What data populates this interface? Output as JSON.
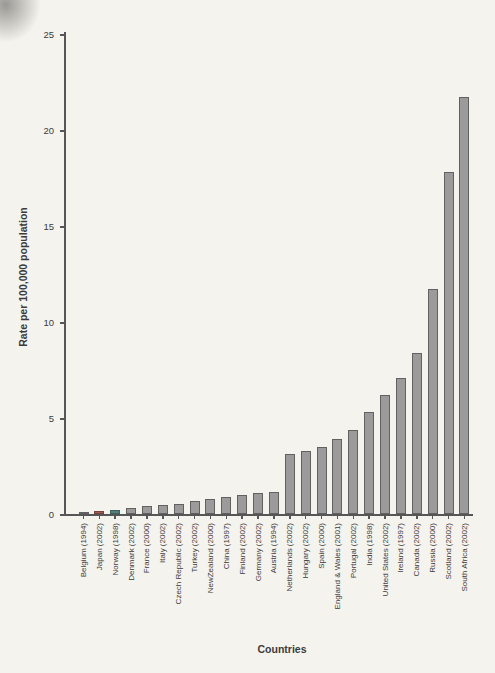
{
  "figure": {
    "background": "#f5f3ee",
    "text_color": "#3b3b3b",
    "axis_color": "#565656",
    "bar_fill": "#9b9b9b",
    "bar_stroke": "#616161"
  },
  "chart_data": {
    "type": "bar",
    "title": "",
    "xlabel": "Countries",
    "ylabel": "Rate per 100,000 population",
    "ylim": [
      0,
      25
    ],
    "yticks": [
      0,
      5,
      10,
      15,
      20,
      25
    ],
    "grid": "off",
    "legend": "none",
    "categories": [
      "Belgium (1994)",
      "Japan (2002)",
      "Norway (1998)",
      "Denmark (2002)",
      "France (2000)",
      "Italy (2002)",
      "Czech Republic (2002)",
      "Turkey (2002)",
      "NewZealand (2000)",
      "China (1997)",
      "Finland (2002)",
      "Germany (2002)",
      "Austria (1994)",
      "Netherlands (2002)",
      "Hungary (2002)",
      "Spain (2000)",
      "England & Wales (2001)",
      "Portugal (2002)",
      "India (1998)",
      "United States (2002)",
      "Ireland (1997)",
      "Canada (2002)",
      "Russia (2000)",
      "Scotland (2002)",
      "South Africa (2002)"
    ],
    "values": [
      0.1,
      0.15,
      0.2,
      0.3,
      0.4,
      0.45,
      0.5,
      0.7,
      0.8,
      0.9,
      1.0,
      1.1,
      1.15,
      3.1,
      3.3,
      3.5,
      3.9,
      4.4,
      5.3,
      6.2,
      7.1,
      8.4,
      11.7,
      17.8,
      21.7
    ],
    "point_colors": {
      "Japan (2002)": {
        "fill": "#9a6058",
        "stroke": "#7c4038"
      },
      "Norway (1998)": {
        "fill": "#567f7c",
        "stroke": "#3a625f"
      }
    }
  }
}
